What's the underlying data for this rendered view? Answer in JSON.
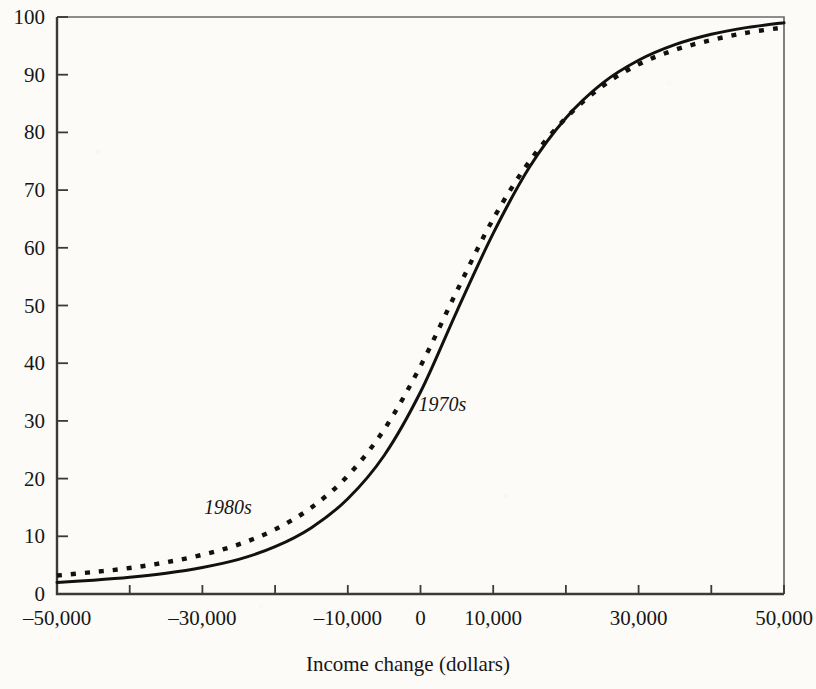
{
  "chart_data": {
    "type": "line",
    "title": "",
    "subtitle": "",
    "xlabel": "Income change (dollars)",
    "ylabel": "",
    "xlim": [
      -50000,
      50000
    ],
    "ylim": [
      0,
      100
    ],
    "grid": false,
    "legend_position": "inline-annotations",
    "xticks": [
      -50000,
      -40000,
      -30000,
      -20000,
      -10000,
      0,
      10000,
      20000,
      30000,
      40000,
      50000
    ],
    "xtick_labels": [
      "-50,000",
      "",
      "-30,000",
      "",
      "-10,000",
      "0",
      "10,000",
      "",
      "30,000",
      "",
      "50,000"
    ],
    "yticks": [
      0,
      10,
      20,
      30,
      40,
      50,
      60,
      70,
      80,
      90,
      100
    ],
    "ytick_labels": [
      "0",
      "10",
      "20",
      "30",
      "40",
      "50",
      "60",
      "70",
      "80",
      "90",
      "100"
    ],
    "x": [
      -50000,
      -45000,
      -40000,
      -35000,
      -30000,
      -25000,
      -20000,
      -15000,
      -10000,
      -5000,
      0,
      5000,
      10000,
      15000,
      20000,
      25000,
      30000,
      35000,
      40000,
      45000,
      50000
    ],
    "series": [
      {
        "name": "1970s",
        "style": "solid",
        "color": "#111111",
        "label_x": 3000,
        "label_y": 33,
        "values": [
          2.0,
          2.4,
          2.9,
          3.6,
          4.6,
          6.0,
          8.2,
          11.5,
          16.5,
          24.0,
          35.0,
          49.0,
          62.5,
          74.0,
          82.5,
          88.5,
          92.5,
          95.2,
          97.0,
          98.2,
          99.0
        ]
      },
      {
        "name": "1980s",
        "style": "dotted",
        "color": "#111111",
        "label_x": -26500,
        "label_y": 15,
        "values": [
          3.2,
          3.8,
          4.5,
          5.5,
          6.8,
          8.6,
          11.2,
          15.0,
          20.5,
          28.5,
          39.5,
          52.5,
          65.0,
          75.0,
          82.5,
          88.0,
          91.8,
          94.3,
          96.0,
          97.3,
          98.2
        ]
      }
    ],
    "annotations": [
      {
        "text": "1970s",
        "x": 3000,
        "y": 33
      },
      {
        "text": "1980s",
        "x": -26500,
        "y": 15
      }
    ],
    "plot_box": {
      "left_px": 57,
      "right_px": 784,
      "top_px": 17,
      "bottom_px": 594
    }
  },
  "axis": {
    "x_title": "Income change (dollars)"
  }
}
